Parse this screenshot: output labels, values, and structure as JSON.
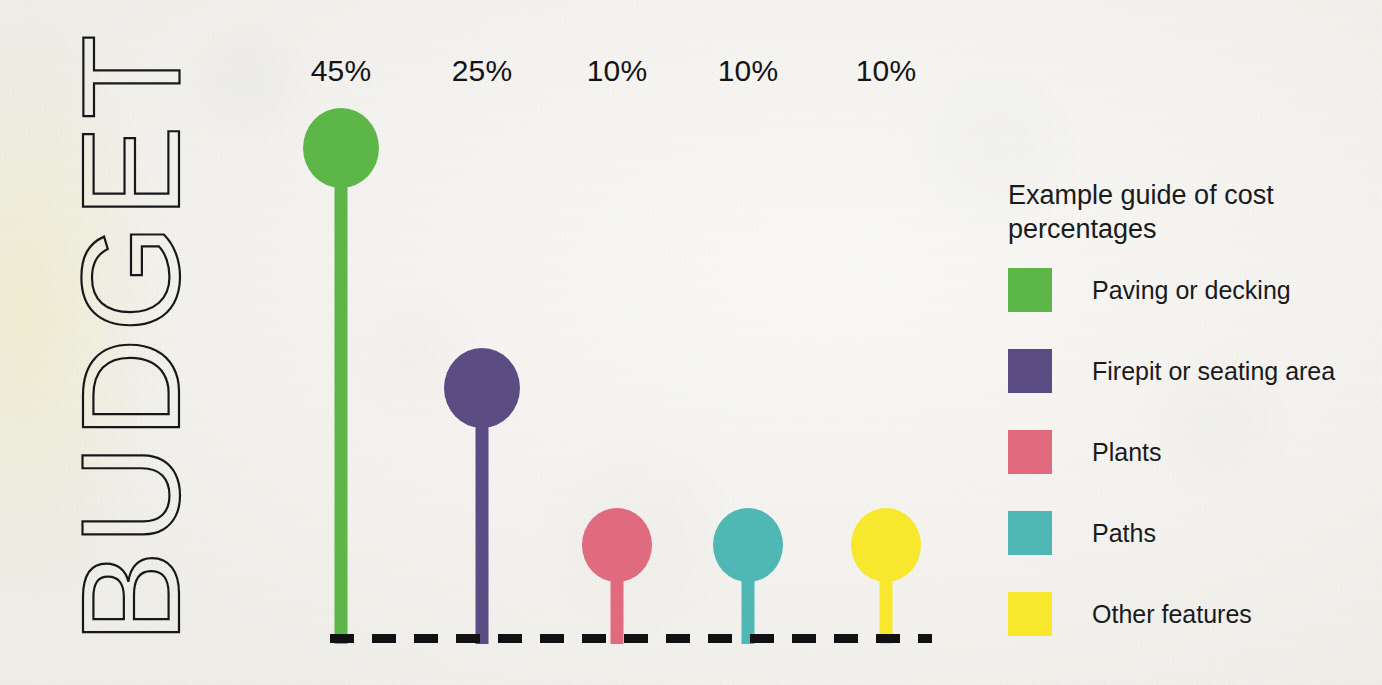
{
  "title": {
    "text": "BUDGET",
    "orientation": "vertical-bottom-to-top"
  },
  "legend": {
    "title": "Example guide of cost percentages",
    "items": [
      {
        "label": "Paving or decking",
        "color": "#5cb648"
      },
      {
        "label": "Firepit or seating area",
        "color": "#5b4d83"
      },
      {
        "label": "Plants",
        "color": "#e06b7e"
      },
      {
        "label": "Paths",
        "color": "#4fb8b5"
      },
      {
        "label": "Other features",
        "color": "#f7e82e"
      }
    ]
  },
  "chart_data": {
    "type": "bar",
    "subtype": "lollipop",
    "title": "BUDGET",
    "xlabel": "",
    "ylabel": "",
    "ylim": [
      0,
      50
    ],
    "grid": false,
    "legend_position": "right",
    "categories": [
      "Paving or decking",
      "Firepit or seating area",
      "Plants",
      "Paths",
      "Other features"
    ],
    "values": [
      45,
      25,
      10,
      10,
      10
    ],
    "value_labels": [
      "45%",
      "25%",
      "10%",
      "10%",
      "10%"
    ],
    "colors": [
      "#5cb648",
      "#5b4d83",
      "#e06b7e",
      "#4fb8b5",
      "#f7e82e"
    ],
    "baseline": {
      "style": "dashed",
      "color": "#111114"
    },
    "annotations": []
  },
  "marks": [
    {
      "label": "45%",
      "color": "#5cb648",
      "cx": 341,
      "head_top": 108,
      "head_w": 76,
      "head_h": 80,
      "stem_w": 13,
      "label_y": 54
    },
    {
      "label": "25%",
      "color": "#5b4d83",
      "cx": 482,
      "head_top": 348,
      "head_w": 76,
      "head_h": 80,
      "stem_w": 13,
      "label_y": 54
    },
    {
      "label": "10%",
      "color": "#e06b7e",
      "cx": 617,
      "head_top": 508,
      "head_w": 70,
      "head_h": 74,
      "stem_w": 13,
      "label_y": 54
    },
    {
      "label": "10%",
      "color": "#4fb8b5",
      "cx": 748,
      "head_top": 508,
      "head_w": 70,
      "head_h": 74,
      "stem_w": 13,
      "label_y": 54
    },
    {
      "label": "10%",
      "color": "#f7e82e",
      "cx": 886,
      "head_top": 508,
      "head_w": 70,
      "head_h": 74,
      "stem_w": 13,
      "label_y": 54
    }
  ],
  "baseline": {
    "left": 330,
    "top": 634,
    "width": 602
  }
}
